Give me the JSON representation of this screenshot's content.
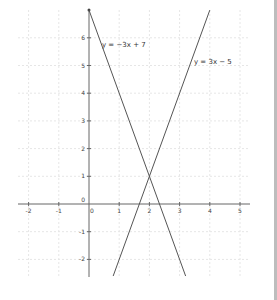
{
  "chart_data": {
    "type": "line",
    "title": "",
    "xlabel": "",
    "ylabel": "",
    "xlim": [
      -2.2,
      5.6
    ],
    "ylim": [
      -2.6,
      7
    ],
    "grid": true,
    "x_ticks": [
      -2,
      -1,
      0,
      1,
      2,
      3,
      4,
      5
    ],
    "y_ticks": [
      -2,
      -1,
      0,
      1,
      2,
      3,
      4,
      5,
      6
    ],
    "series": [
      {
        "name": "y = −3x + 7",
        "slope": -3,
        "intercept": 7,
        "x": [
          0,
          3.2
        ],
        "y": [
          7,
          -2.6
        ],
        "color": "#555555"
      },
      {
        "name": "y = 3x − 5",
        "slope": 3,
        "intercept": -5,
        "x": [
          0.8,
          4.0
        ],
        "y": [
          -2.6,
          7
        ],
        "color": "#555555"
      }
    ],
    "annotations": [
      {
        "text": "y = −3x + 7",
        "x": 0.4,
        "y": 6
      },
      {
        "text": "y = 3x − 5",
        "x": 3.5,
        "y": 5.3
      }
    ],
    "intersection": {
      "x": 2,
      "y": 1
    }
  },
  "labels": {
    "eq1": "y = −3x + 7",
    "eq2": "y = 3x − 5",
    "x_ticks": [
      "-2",
      "-1",
      "0",
      "1",
      "2",
      "3",
      "4",
      "5"
    ],
    "y_ticks": [
      "6",
      "5",
      "4",
      "3",
      "2",
      "1",
      "0",
      "-1",
      "-2"
    ]
  }
}
